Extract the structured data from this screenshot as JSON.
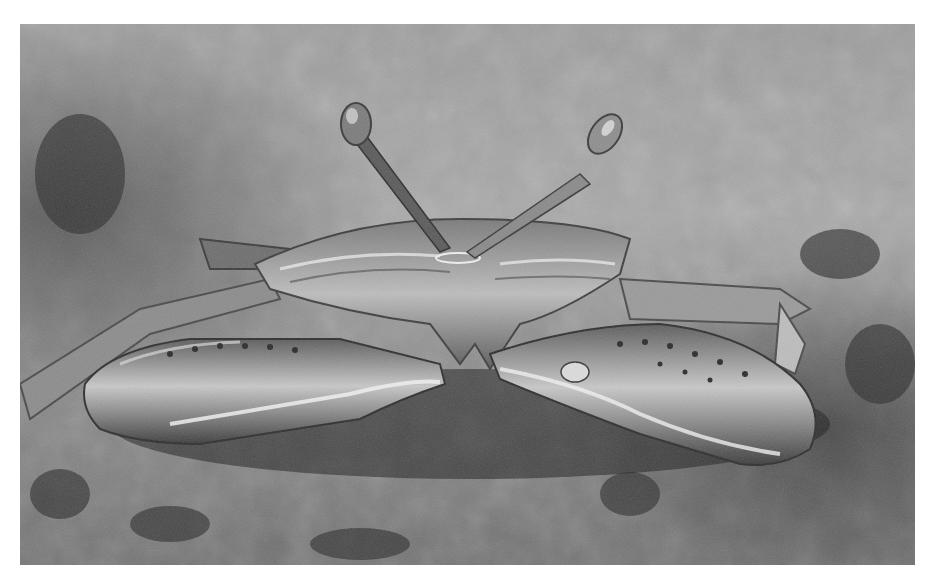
{
  "image": {
    "subject": "crab",
    "description": "Grayscale close-up photograph of a crab with raised stalked eyes resting on sandy ground, claws extended toward the viewer",
    "palette": {
      "background": "#ffffff",
      "sand_light": "#b8b8b8",
      "sand_mid": "#8a8a8a",
      "sand_dark": "#3a3a3a",
      "shell_highlight": "#e6e6e6",
      "shell_mid": "#9a9a9a",
      "shell_dark": "#4a4a4a"
    }
  }
}
